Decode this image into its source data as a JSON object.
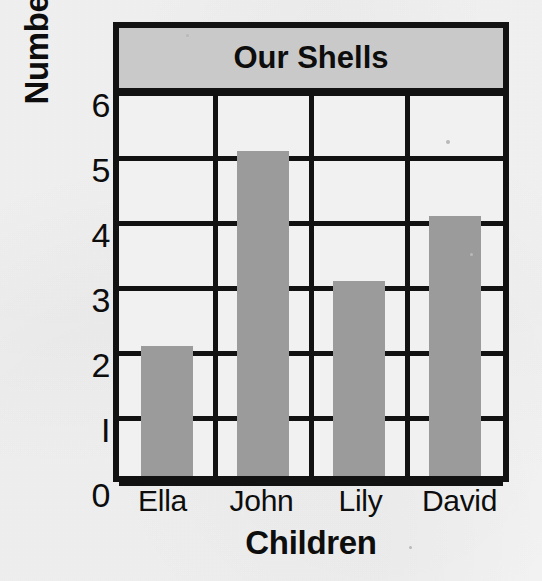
{
  "chart_data": {
    "type": "bar",
    "title": "Our Shells",
    "xlabel": "Children",
    "ylabel": "Number of Shells",
    "categories": [
      "Ella",
      "John",
      "Lily",
      "David"
    ],
    "values": [
      2,
      5,
      3,
      4
    ],
    "yticks": [
      "0",
      "1",
      "2",
      "3",
      "4",
      "5",
      "6"
    ],
    "ylim": [
      0,
      6
    ],
    "grid": true,
    "legend": "none",
    "bar_color": "#9b9b9b",
    "title_band_color": "#c9c9c9",
    "frame_color": "#121212",
    "plot_background": "#f1f1f1"
  }
}
